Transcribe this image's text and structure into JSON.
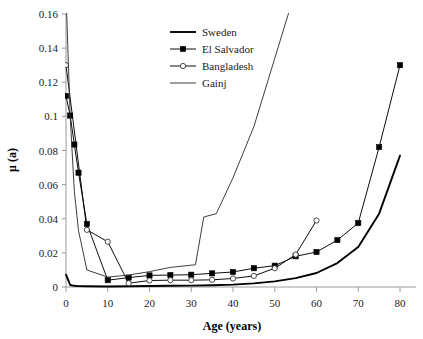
{
  "chart_data": {
    "type": "line",
    "title": "",
    "xlabel": "Age (years)",
    "ylabel": "μ (a)",
    "xlim": [
      0,
      83
    ],
    "ylim": [
      0,
      0.16
    ],
    "xticks": [
      0,
      10,
      20,
      30,
      40,
      50,
      60,
      70,
      80
    ],
    "xtick_labels": [
      "0",
      "10",
      "20",
      "30",
      "40",
      "50",
      "60",
      "70",
      "80"
    ],
    "yticks": [
      0,
      0.02,
      0.04,
      0.06,
      0.08,
      0.1,
      0.12,
      0.14,
      0.16
    ],
    "ytick_labels": [
      "0",
      "0.02",
      "0.04",
      "0.06",
      "0.08",
      "0.1",
      "0.12",
      "0.14",
      "0.16"
    ],
    "grid": false,
    "legend_position": "top-center",
    "series": [
      {
        "name": "Sweden",
        "marker": "none",
        "line": "solid-thick",
        "color": "#000000",
        "x": [
          0,
          1,
          2,
          3,
          5,
          10,
          15,
          20,
          25,
          30,
          35,
          40,
          45,
          50,
          55,
          60,
          65,
          70,
          75,
          80
        ],
        "y": [
          0.0072,
          0.0012,
          0.0007,
          0.0005,
          0.0004,
          0.0003,
          0.0004,
          0.0006,
          0.0007,
          0.0008,
          0.001,
          0.0014,
          0.0021,
          0.0033,
          0.0052,
          0.0082,
          0.014,
          0.0235,
          0.043,
          0.077
        ]
      },
      {
        "name": "El Salvador",
        "marker": "filled-square",
        "line": "solid-thin",
        "color": "#000000",
        "x": [
          0,
          1,
          2,
          3,
          5,
          10,
          15,
          20,
          25,
          30,
          35,
          40,
          45,
          50,
          55,
          60,
          65,
          70,
          75,
          80
        ],
        "y": [
          0.112,
          0.1005,
          0.0835,
          0.067,
          0.037,
          0.004,
          0.0055,
          0.0068,
          0.007,
          0.0072,
          0.008,
          0.0088,
          0.011,
          0.0125,
          0.018,
          0.0205,
          0.0275,
          0.0375,
          0.082,
          0.13
        ]
      },
      {
        "name": "Bangladesh",
        "marker": "open-circle",
        "line": "solid-thin",
        "color": "#000000",
        "x": [
          0,
          5,
          10,
          15,
          20,
          25,
          30,
          35,
          40,
          45,
          50,
          55,
          60
        ],
        "y": [
          0.13,
          0.0335,
          0.0265,
          0.0022,
          0.0038,
          0.004,
          0.004,
          0.0042,
          0.005,
          0.0065,
          0.011,
          0.019,
          0.039
        ]
      },
      {
        "name": "Gainj",
        "marker": "none",
        "line": "solid-thin",
        "color": "#333333",
        "x": [
          0,
          1,
          2,
          3,
          5,
          10,
          15,
          20,
          25,
          30,
          31,
          33,
          36,
          40,
          45,
          50,
          54
        ],
        "y": [
          0.172,
          0.1,
          0.056,
          0.033,
          0.01,
          0.0058,
          0.007,
          0.009,
          0.0115,
          0.0128,
          0.013,
          0.041,
          0.043,
          0.064,
          0.094,
          0.134,
          0.166
        ]
      }
    ],
    "notes": {
      "bangladesh_anomaly_x": [
        5,
        10
      ],
      "clipped_top": [
        "Sweden",
        "Gainj"
      ]
    }
  },
  "legend": {
    "items": [
      {
        "label": "Sweden"
      },
      {
        "label": "El Salvador"
      },
      {
        "label": "Bangladesh"
      },
      {
        "label": "Gainj"
      }
    ]
  }
}
